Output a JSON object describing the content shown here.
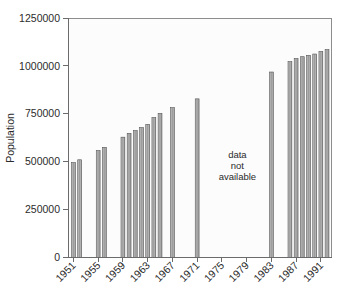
{
  "chart_data": {
    "type": "bar",
    "title": "",
    "subtitle": "",
    "xlabel": "",
    "ylabel": "Population",
    "ylim": [
      0,
      1250000
    ],
    "ytick_values": [
      0,
      250000,
      500000,
      750000,
      1000000,
      1250000
    ],
    "ytick_labels": [
      "0",
      "250000",
      "500000",
      "750000",
      "1000000",
      "1250000"
    ],
    "xlim": [
      1950.2,
      1992.8
    ],
    "xtick_values": [
      1951,
      1955,
      1959,
      1963,
      1967,
      1971,
      1975,
      1979,
      1983,
      1987,
      1991
    ],
    "xtick_labels": [
      "1951",
      "1955",
      "1959",
      "1963",
      "1967",
      "1971",
      "1975",
      "1979",
      "1983",
      "1987",
      "1991"
    ],
    "xtick_rotation": 45,
    "grid": false,
    "legend": null,
    "bar_color": "#a8a8a8",
    "bar_edge_color": "#555555",
    "categories": [
      1951,
      1952,
      1955,
      1956,
      1959,
      1960,
      1961,
      1962,
      1963,
      1964,
      1965,
      1967,
      1971,
      1983,
      1986,
      1987,
      1988,
      1989,
      1990,
      1991,
      1992
    ],
    "values": [
      495000,
      510000,
      558000,
      575000,
      628000,
      648000,
      662000,
      678000,
      695000,
      730000,
      752000,
      782000,
      828000,
      968000,
      1022000,
      1038000,
      1048000,
      1055000,
      1062000,
      1075000,
      1085000
    ],
    "annotations": [
      {
        "text_lines": [
          "data",
          "not",
          "available"
        ],
        "x": 1977.5,
        "y": 520000
      }
    ]
  },
  "annotation": {
    "line1": "data",
    "line2": "not",
    "line3": "available"
  },
  "axes": {
    "y_title": "Population"
  }
}
